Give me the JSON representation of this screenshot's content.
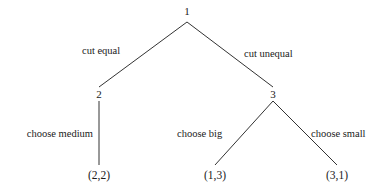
{
  "diagram": {
    "type": "extensive-form-game-tree",
    "title": "",
    "background_color": "#ffffff",
    "line_color": "#333333",
    "text_color": "#1a1a1a",
    "nodes": [
      {
        "id": "root",
        "label": "1",
        "x": 187,
        "y": 11,
        "role": "decision-node-player-1"
      },
      {
        "id": "left",
        "label": "2",
        "x": 99,
        "y": 94,
        "role": "decision-node-player-2"
      },
      {
        "id": "right",
        "label": "3",
        "x": 273,
        "y": 94,
        "role": "decision-node-player-2"
      }
    ],
    "terminals": [
      {
        "id": "t1",
        "label": "(2,2)",
        "x": 99,
        "y": 176
      },
      {
        "id": "t2",
        "label": "(1,3)",
        "x": 215,
        "y": 176
      },
      {
        "id": "t3",
        "label": "(3,1)",
        "x": 337,
        "y": 176
      }
    ],
    "edges": [
      {
        "id": "e1",
        "from": "root",
        "to": "left",
        "x1": 187,
        "y1": 22,
        "x2": 99,
        "y2": 87
      },
      {
        "id": "e2",
        "from": "root",
        "to": "right",
        "x1": 187,
        "y1": 22,
        "x2": 273,
        "y2": 87
      },
      {
        "id": "e3",
        "from": "left",
        "to": "t1",
        "x1": 99,
        "y1": 101,
        "x2": 99,
        "y2": 165
      },
      {
        "id": "e4",
        "from": "right",
        "to": "t2",
        "x1": 273,
        "y1": 101,
        "x2": 215,
        "y2": 165
      },
      {
        "id": "e5",
        "from": "right",
        "to": "t3",
        "x1": 273,
        "y1": 101,
        "x2": 337,
        "y2": 165
      }
    ],
    "edge_labels": [
      {
        "id": "l1",
        "text": "cut equal",
        "x": 82,
        "y": 51,
        "anchor": "start"
      },
      {
        "id": "l2",
        "text": "cut unequal",
        "x": 244,
        "y": 54,
        "anchor": "start"
      },
      {
        "id": "l3",
        "text": "choose medium",
        "x": 93,
        "y": 134,
        "anchor": "end"
      },
      {
        "id": "l4",
        "text": "choose big",
        "x": 177,
        "y": 134,
        "anchor": "start"
      },
      {
        "id": "l5",
        "text": "choose small",
        "x": 311,
        "y": 134,
        "anchor": "start"
      }
    ]
  }
}
